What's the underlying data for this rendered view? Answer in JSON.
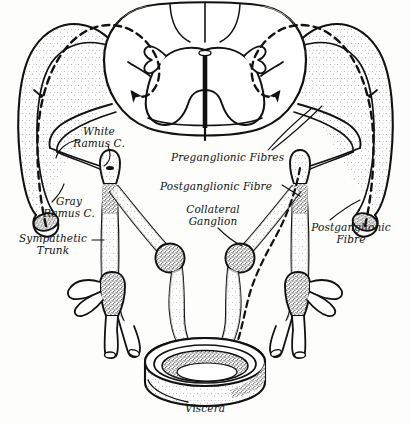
{
  "figure": {
    "background_color": "#fdfdfc",
    "ink_color": "#111111",
    "style": "pen-and-ink stipple anatomical illustration"
  },
  "labels": {
    "white_ramus": "White\nRamus C.",
    "gray_ramus": "Gray\nRamus C.",
    "sympathetic_trunk": "Sympathetic\nTrunk",
    "preganglionic_fibres": "Preganglionic Fibres",
    "postganglionic_fibre_center": "Postganglionic Fibre",
    "collateral_ganglion": "Collateral\nGanglion",
    "postganglionic_fibre_right": "Postganglionic\nFibre",
    "viscera": "Viscera"
  },
  "structures": {
    "spinal_cord": "spinal cord cross-section",
    "gray_matter": "butterfly-shaped gray matter",
    "central_canal": "central canal",
    "dorsal_root": "dorsal root",
    "ventral_root": "ventral root",
    "spinal_nerve_left": "left spinal nerve",
    "spinal_nerve_right": "right spinal nerve",
    "trunk_ganglion_left": "left sympathetic chain ganglion",
    "trunk_ganglion_right": "right sympathetic chain ganglion",
    "collateral_ganglion_left": "left collateral ganglion",
    "collateral_ganglion_right": "right collateral ganglion",
    "viscera_organ": "hollow viscus ring segment"
  },
  "pathways": {
    "dashed_reflex_left": "dashed afferent/efferent reflex arc, left",
    "dashed_reflex_right": "dashed afferent/efferent reflex arc, right",
    "arrow_into_cord_left": "arrow entering left dorsal horn",
    "arrow_into_cord_right": "arrow entering right dorsal horn",
    "arrow_terminal_left": "arrow at left cut nerve end",
    "arrow_terminal_right": "arrow at right cut nerve end"
  }
}
